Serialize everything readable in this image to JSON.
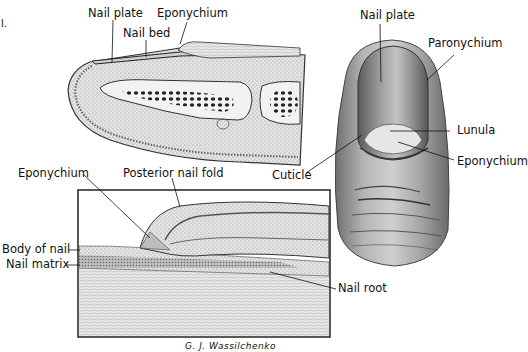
{
  "figure": {
    "corner_mark": "l.",
    "signature": "G. J. Wassilchenko"
  },
  "sagittal_view": {
    "labels": {
      "nail_plate": "Nail plate",
      "eponychium": "Eponychium",
      "nail_bed": "Nail bed"
    }
  },
  "dorsal_view": {
    "labels": {
      "nail_plate": "Nail plate",
      "paronychium": "Paronychium",
      "lunula": "Lunula",
      "eponychium": "Eponychium",
      "cuticle": "Cuticle"
    }
  },
  "detail_view": {
    "labels": {
      "eponychium": "Eponychium",
      "posterior_nail_fold": "Posterior nail fold",
      "body_of_nail": "Body of nail",
      "nail_matrix": "Nail matrix",
      "nail_root": "Nail root"
    }
  },
  "colors": {
    "ink": "#111111",
    "tissue_light": "#d9d9d9",
    "tissue_mid": "#a8a8a8",
    "tissue_dark": "#555555",
    "bone_marrow": "#2a2a2a",
    "background": "#ffffff"
  }
}
